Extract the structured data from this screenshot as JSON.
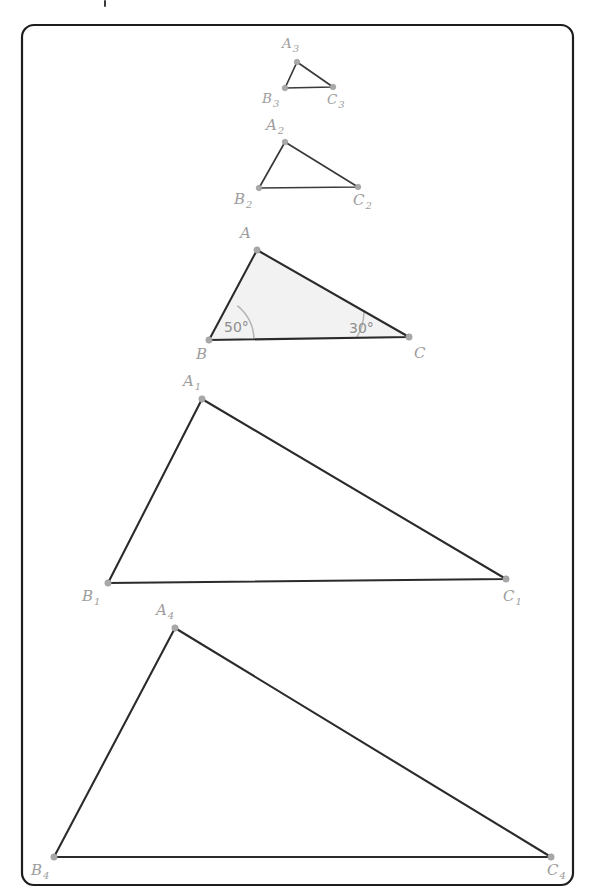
{
  "figure": {
    "canvas": {
      "width": 595,
      "height": 896
    },
    "frame": {
      "x": 22,
      "y": 25,
      "width": 551,
      "height": 860,
      "radius": 12
    },
    "colors": {
      "edge": "#2b2b2b",
      "vertex_dot": "#a8a8a8",
      "label": "#9d9d9d",
      "angle_arc": "#b4b4b4",
      "angle_label": "#8e8e8e",
      "triangle_fill": "#f2f2f2",
      "frame_stroke": "#1d1d1d",
      "background": "#ffffff"
    },
    "triangles": [
      {
        "id": "triangle-3",
        "name": "A3B3C3",
        "scale_rank": 1,
        "filled": false,
        "vertices": [
          {
            "key": "A3",
            "label": "A",
            "subscript": "3",
            "x": 297,
            "y": 62,
            "label_x": 282,
            "label_y": 48,
            "size": "small"
          },
          {
            "key": "B3",
            "label": "B",
            "subscript": "3",
            "x": 285,
            "y": 88,
            "label_x": 262,
            "label_y": 103,
            "size": "small"
          },
          {
            "key": "C3",
            "label": "C",
            "subscript": "3",
            "x": 333,
            "y": 87,
            "label_x": 327,
            "label_y": 104,
            "size": "small"
          }
        ]
      },
      {
        "id": "triangle-2",
        "name": "A2B2C2",
        "scale_rank": 2,
        "filled": false,
        "vertices": [
          {
            "key": "A2",
            "label": "A",
            "subscript": "2",
            "x": 285,
            "y": 142,
            "label_x": 266,
            "label_y": 130,
            "size": "normal"
          },
          {
            "key": "B2",
            "label": "B",
            "subscript": "2",
            "x": 259,
            "y": 188,
            "label_x": 234,
            "label_y": 204,
            "size": "normal"
          },
          {
            "key": "C2",
            "label": "C",
            "subscript": "2",
            "x": 358,
            "y": 187,
            "label_x": 353,
            "label_y": 205,
            "size": "normal"
          }
        ]
      },
      {
        "id": "triangle-abc",
        "name": "ABC",
        "scale_rank": 3,
        "filled": true,
        "vertices": [
          {
            "key": "A",
            "label": "A",
            "subscript": "",
            "x": 257,
            "y": 250,
            "label_x": 240,
            "label_y": 238,
            "size": "normal"
          },
          {
            "key": "B",
            "label": "B",
            "subscript": "",
            "x": 209,
            "y": 340,
            "label_x": 196,
            "label_y": 359,
            "size": "normal"
          },
          {
            "key": "C",
            "label": "C",
            "subscript": "",
            "x": 409,
            "y": 337,
            "label_x": 414,
            "label_y": 358,
            "size": "normal"
          }
        ],
        "angles": [
          {
            "at": "B",
            "value": "50°",
            "degrees": 50,
            "cx": 209,
            "cy": 340,
            "radius": 45,
            "label_x": 224,
            "label_y": 332,
            "arc_start_x": 254,
            "arc_start_y": 340,
            "arc_end_x": 237.3,
            "arc_end_y": 305.7
          },
          {
            "at": "C",
            "value": "30°",
            "degrees": 30,
            "cx": 409,
            "cy": 337,
            "radius": 52,
            "label_x": 349,
            "label_y": 333,
            "arc_start_x": 357,
            "arc_start_y": 337,
            "arc_end_x": 364.0,
            "arc_end_y": 311.0
          }
        ]
      },
      {
        "id": "triangle-1",
        "name": "A1B1C1",
        "scale_rank": 4,
        "filled": false,
        "vertices": [
          {
            "key": "A1",
            "label": "A",
            "subscript": "1",
            "x": 202,
            "y": 399,
            "label_x": 183,
            "label_y": 386,
            "size": "normal"
          },
          {
            "key": "B1",
            "label": "B",
            "subscript": "1",
            "x": 108,
            "y": 583,
            "label_x": 82,
            "label_y": 601,
            "size": "normal"
          },
          {
            "key": "C1",
            "label": "C",
            "subscript": "1",
            "x": 506,
            "y": 579,
            "label_x": 503,
            "label_y": 601,
            "size": "normal"
          }
        ]
      },
      {
        "id": "triangle-4",
        "name": "A4B4C4",
        "scale_rank": 5,
        "filled": false,
        "vertices": [
          {
            "key": "A4",
            "label": "A",
            "subscript": "4",
            "x": 175,
            "y": 628,
            "label_x": 156,
            "label_y": 615,
            "size": "normal"
          },
          {
            "key": "B4",
            "label": "B",
            "subscript": "4",
            "x": 54,
            "y": 857,
            "label_x": 31,
            "label_y": 875,
            "size": "normal"
          },
          {
            "key": "C4",
            "label": "C",
            "subscript": "4",
            "x": 551,
            "y": 857,
            "label_x": 547,
            "label_y": 875,
            "size": "normal"
          }
        ]
      }
    ]
  }
}
